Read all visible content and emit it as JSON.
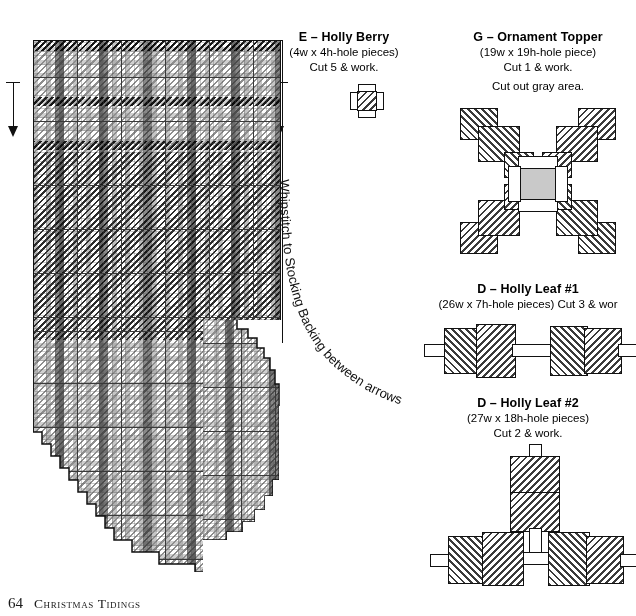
{
  "page": {
    "number": "64",
    "book_title": "Christmas Tidings"
  },
  "stocking": {
    "title": "F – Stocking Front",
    "subtitle": "(51w x 66h-hole piece) Cut 1 & work.",
    "annotation": "Whipstitch to Stocking Backing between arrows",
    "arrow_left": "down-arrow",
    "arrow_right": "down-arrow"
  },
  "berry": {
    "title": "E – Holly Berry",
    "subtitle_1": "(4w x 4h-hole pieces)",
    "subtitle_2": "Cut 5 & work."
  },
  "topper": {
    "title": "G – Ornament Topper",
    "subtitle_1": "(19w x 19h-hole piece)",
    "subtitle_2": "Cut 1 & work.",
    "subtitle_3": "Cut out gray area."
  },
  "leaf1": {
    "title": "D – Holly Leaf #1",
    "subtitle": "(26w x 7h-hole pieces) Cut 3 & wor"
  },
  "leaf2": {
    "title": "D – Holly Leaf #2",
    "subtitle_1": "(27w x 18h-hole pieces)",
    "subtitle_2": "Cut 2 & work."
  },
  "colors": {
    "ink": "#111111",
    "gray_cutout": "#c9c9c9",
    "stitch_dark": "#2b2b2b",
    "stitch_mid": "#8e8e8e"
  }
}
